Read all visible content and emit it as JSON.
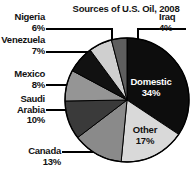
{
  "chart_data": {
    "type": "pie",
    "title": "Sources of U.S. Oil, 2008",
    "xlabel": "",
    "ylabel": "",
    "legend_position": "callout-labels",
    "grid": false,
    "categories": [
      "Domestic",
      "Other",
      "Canada",
      "Saudi Arabia",
      "Mexico",
      "Venezuela",
      "Nigeria",
      "Iraq"
    ],
    "values": [
      34,
      17,
      13,
      10,
      8,
      7,
      6,
      4
    ],
    "value_unit": "percent",
    "slices": [
      {
        "label": "Domestic",
        "value": 34,
        "value_text": "34%",
        "color": "#0d0d0d",
        "label_placement": "inside",
        "text_color": "#ffffff"
      },
      {
        "label": "Other",
        "value": 17,
        "value_text": "17%",
        "color": "#d9d9d9",
        "label_placement": "inside",
        "text_color": "#111111"
      },
      {
        "label": "Canada",
        "value": 13,
        "value_text": "13%",
        "color": "#8a8a8a",
        "label_placement": "outside",
        "text_color": "#111111"
      },
      {
        "label": "Saudi Arabia",
        "value": 10,
        "value_text": "10%",
        "color": "#3a3a3a",
        "label_placement": "outside",
        "text_color": "#111111"
      },
      {
        "label": "Mexico",
        "value": 8,
        "value_text": "8%",
        "color": "#959595",
        "label_placement": "outside",
        "text_color": "#111111"
      },
      {
        "label": "Venezuela",
        "value": 7,
        "value_text": "7%",
        "color": "#111111",
        "label_placement": "outside",
        "text_color": "#111111"
      },
      {
        "label": "Nigeria",
        "value": 6,
        "value_text": "6%",
        "color": "#cfcfcf",
        "label_placement": "outside",
        "text_color": "#111111"
      },
      {
        "label": "Iraq",
        "value": 4,
        "value_text": "4%",
        "color": "#5e5e5e",
        "label_placement": "outside",
        "text_color": "#111111"
      }
    ]
  },
  "title": "Sources of U.S. Oil, 2008",
  "callouts": {
    "nigeria": {
      "name": "Nigeria",
      "value": "6%"
    },
    "venezuela": {
      "name": "Venezuela",
      "value": "7%"
    },
    "mexico": {
      "name": "Mexico",
      "value": "8%"
    },
    "saudi_arabia": {
      "name_line1": "Saudi",
      "name_line2": "Arabia",
      "value": "10%"
    },
    "canada": {
      "name": "Canada",
      "value": "13%"
    },
    "iraq": {
      "name": "Iraq",
      "value": "4%"
    }
  },
  "inside_labels": {
    "domestic": {
      "name": "Domestic",
      "value": "34%"
    },
    "other": {
      "name": "Other",
      "value": "17%"
    }
  },
  "colors": {
    "domestic": "#0d0d0d",
    "other": "#d9d9d9",
    "canada": "#8a8a8a",
    "saudi_arabia": "#3a3a3a",
    "mexico": "#959595",
    "venezuela": "#111111",
    "nigeria": "#cfcfcf",
    "iraq": "#5e5e5e",
    "outline": "#000000",
    "leader_line": "#000000",
    "background": "#ffffff"
  }
}
